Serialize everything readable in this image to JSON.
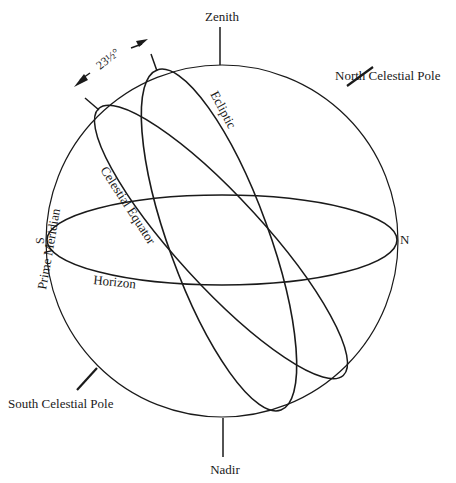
{
  "diagram": {
    "type": "celestial-sphere",
    "labels": {
      "zenith": "Zenith",
      "nadir": "Nadir",
      "north_celestial_pole": "North Celestial Pole",
      "south_celestial_pole": "South Celestial Pole",
      "ecliptic": "Ecliptic",
      "celestial_equator": "Celestial Equator",
      "horizon": "Horizon",
      "prime_meridian": "Prime   Meridian",
      "north": "N",
      "south": "S",
      "obliquity": "23½°"
    },
    "colors": {
      "line": "#1a1a1a",
      "background": "#ffffff"
    }
  }
}
